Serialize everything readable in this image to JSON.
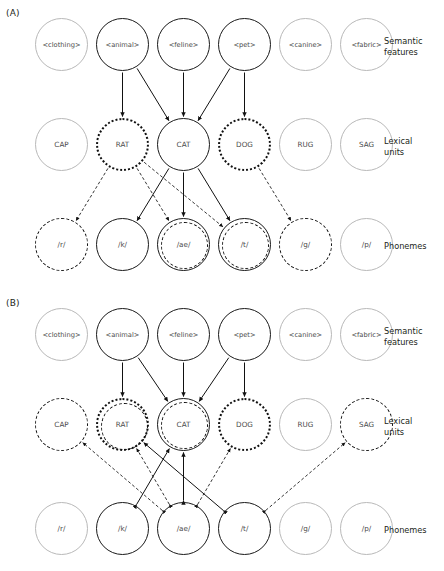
{
  "figure": {
    "panels": [
      {
        "id": "A",
        "label": "(A)",
        "rows": [
          {
            "id": "semantic",
            "label": "Semantic\nfeatures",
            "label_line1": "Semantic",
            "label_line2": "features",
            "nodes": [
              {
                "text": "<clothing>",
                "style": "faint"
              },
              {
                "text": "<animal>",
                "style": "solid"
              },
              {
                "text": "<feline>",
                "style": "solid"
              },
              {
                "text": "<pet>",
                "style": "solid"
              },
              {
                "text": "<canine>",
                "style": "faint"
              },
              {
                "text": "<fabric>",
                "style": "faint"
              }
            ]
          },
          {
            "id": "lexical",
            "label_line1": "Lexical",
            "label_line2": "units",
            "nodes": [
              {
                "text": "CAP",
                "style": "faint"
              },
              {
                "text": "RAT",
                "style": "dotted"
              },
              {
                "text": "CAT",
                "style": "solid"
              },
              {
                "text": "DOG",
                "style": "dotted"
              },
              {
                "text": "RUG",
                "style": "faint"
              },
              {
                "text": "SAG",
                "style": "faint"
              }
            ]
          },
          {
            "id": "phonemes",
            "label_line1": "Phonemes",
            "label_line2": "",
            "nodes": [
              {
                "text": "/r/",
                "style": "dashed"
              },
              {
                "text": "/k/",
                "style": "solid"
              },
              {
                "text": "/ae/",
                "style": "solid-dashed"
              },
              {
                "text": "/t/",
                "style": "solid-dashed"
              },
              {
                "text": "/g/",
                "style": "dashed"
              },
              {
                "text": "/p/",
                "style": "faint"
              }
            ]
          }
        ],
        "edges": [
          {
            "from": "semantic.1",
            "to": "lexical.1",
            "kind": "solid",
            "dir": "down"
          },
          {
            "from": "semantic.1",
            "to": "lexical.2",
            "kind": "solid",
            "dir": "down"
          },
          {
            "from": "semantic.2",
            "to": "lexical.2",
            "kind": "solid",
            "dir": "down"
          },
          {
            "from": "semantic.3",
            "to": "lexical.2",
            "kind": "solid",
            "dir": "down"
          },
          {
            "from": "semantic.3",
            "to": "lexical.3",
            "kind": "solid",
            "dir": "down"
          },
          {
            "from": "lexical.1",
            "to": "phonemes.0",
            "kind": "dashed",
            "dir": "down"
          },
          {
            "from": "lexical.1",
            "to": "phonemes.2",
            "kind": "dashed",
            "dir": "down"
          },
          {
            "from": "lexical.1",
            "to": "phonemes.3",
            "kind": "dashed",
            "dir": "down"
          },
          {
            "from": "lexical.2",
            "to": "phonemes.1",
            "kind": "solid",
            "dir": "down"
          },
          {
            "from": "lexical.2",
            "to": "phonemes.2",
            "kind": "solid",
            "dir": "down"
          },
          {
            "from": "lexical.2",
            "to": "phonemes.3",
            "kind": "solid",
            "dir": "down"
          },
          {
            "from": "lexical.3",
            "to": "phonemes.4",
            "kind": "dashed",
            "dir": "down"
          }
        ]
      },
      {
        "id": "B",
        "label": "(B)",
        "rows": [
          {
            "id": "semantic",
            "label_line1": "Semantic",
            "label_line2": "features",
            "nodes": [
              {
                "text": "<clothing>",
                "style": "faint"
              },
              {
                "text": "<animal>",
                "style": "solid"
              },
              {
                "text": "<feline>",
                "style": "solid"
              },
              {
                "text": "<pet>",
                "style": "solid"
              },
              {
                "text": "<canine>",
                "style": "faint"
              },
              {
                "text": "<fabric>",
                "style": "faint"
              }
            ]
          },
          {
            "id": "lexical",
            "label_line1": "Lexical",
            "label_line2": "units",
            "nodes": [
              {
                "text": "CAP",
                "style": "dashed"
              },
              {
                "text": "RAT",
                "style": "dotted-dashed"
              },
              {
                "text": "CAT",
                "style": "solid-dashed"
              },
              {
                "text": "DOG",
                "style": "dotted"
              },
              {
                "text": "RUG",
                "style": "faint"
              },
              {
                "text": "SAG",
                "style": "dashed"
              }
            ]
          },
          {
            "id": "phonemes",
            "label_line1": "Phonemes",
            "label_line2": "",
            "nodes": [
              {
                "text": "/r/",
                "style": "faint"
              },
              {
                "text": "/k/",
                "style": "solid"
              },
              {
                "text": "/ae/",
                "style": "solid"
              },
              {
                "text": "/t/",
                "style": "solid"
              },
              {
                "text": "/g/",
                "style": "faint"
              },
              {
                "text": "/p/",
                "style": "faint"
              }
            ]
          }
        ],
        "edges": [
          {
            "from": "semantic.1",
            "to": "lexical.1",
            "kind": "solid",
            "dir": "down"
          },
          {
            "from": "semantic.1",
            "to": "lexical.2",
            "kind": "solid",
            "dir": "down"
          },
          {
            "from": "semantic.2",
            "to": "lexical.2",
            "kind": "solid",
            "dir": "down"
          },
          {
            "from": "semantic.3",
            "to": "lexical.2",
            "kind": "solid",
            "dir": "down"
          },
          {
            "from": "semantic.3",
            "to": "lexical.3",
            "kind": "solid",
            "dir": "down"
          },
          {
            "from": "phonemes.2",
            "to": "lexical.0",
            "kind": "dashed",
            "dir": "both"
          },
          {
            "from": "phonemes.2",
            "to": "lexical.1",
            "kind": "dashed",
            "dir": "both"
          },
          {
            "from": "phonemes.2",
            "to": "lexical.2",
            "kind": "solid",
            "dir": "both"
          },
          {
            "from": "phonemes.1",
            "to": "lexical.2",
            "kind": "solid",
            "dir": "both"
          },
          {
            "from": "phonemes.3",
            "to": "lexical.1",
            "kind": "solid",
            "dir": "both"
          },
          {
            "from": "phonemes.3",
            "to": "lexical.5",
            "kind": "dashed",
            "dir": "both"
          },
          {
            "from": "phonemes.2",
            "to": "lexical.3",
            "kind": "dashed",
            "dir": "both"
          }
        ]
      }
    ]
  },
  "colors": {
    "ink": "#231f20",
    "faint": "#b9b9b9",
    "bold": "#1a1a1a",
    "background": "#ffffff"
  },
  "geometry": {
    "node_diameter": 53,
    "node_x": [
      35,
      96,
      157,
      218,
      279,
      340
    ],
    "panelA_row_y": [
      18,
      118,
      218
    ],
    "panelB_row_y": [
      18,
      108,
      212
    ]
  }
}
